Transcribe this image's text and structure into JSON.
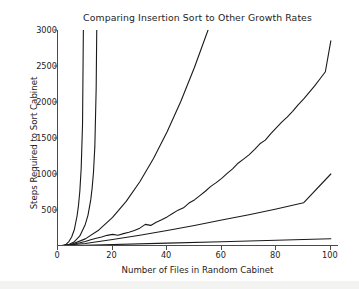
{
  "chart_data": {
    "type": "line",
    "title": "Comparing Insertion Sort to Other Growth Rates",
    "xlabel": "Number of Files in Random Cabinet",
    "ylabel": "Steps Required to Sort Cabinet",
    "xlim": [
      0,
      103
    ],
    "ylim": [
      0,
      3000
    ],
    "xticks": [
      0,
      20,
      40,
      60,
      80,
      100
    ],
    "yticks": [
      500,
      1000,
      1500,
      2000,
      2500,
      3000
    ],
    "grid": false,
    "legend": null,
    "series": [
      {
        "name": "steep-growth-a",
        "note": "fastest growing curve, leaves top of axes near x = 9",
        "x": [
          0,
          1,
          2,
          3,
          4,
          5,
          6,
          7,
          7.5,
          8,
          8.5,
          9,
          9.3
        ],
        "values": [
          0,
          2,
          8,
          26,
          62,
          125,
          230,
          420,
          560,
          760,
          1080,
          1700,
          3000
        ]
      },
      {
        "name": "steep-growth-b",
        "note": "second fastest curve, leaves top of axes near x = 14",
        "x": [
          0,
          2,
          4,
          6,
          8,
          10,
          11,
          12,
          12.5,
          13,
          13.5,
          14,
          14.2
        ],
        "values": [
          0,
          4,
          20,
          60,
          140,
          300,
          430,
          640,
          800,
          1020,
          1380,
          2200,
          3000
        ]
      },
      {
        "name": "quadratic-growth",
        "note": "smooth n-squared style curve, leaves top of axes near x = 55",
        "x": [
          0,
          5,
          10,
          15,
          20,
          25,
          30,
          35,
          40,
          45,
          50,
          55
        ],
        "values": [
          0,
          25,
          99,
          223,
          397,
          620,
          893,
          1215,
          1587,
          2008,
          2479,
          3000
        ]
      },
      {
        "name": "insertion-sort-random",
        "note": "noisy measured insertion sort curve reaching about 2850 at x = 100",
        "x": [
          0,
          2,
          4,
          6,
          8,
          10,
          12,
          14,
          16,
          18,
          20,
          22,
          24,
          26,
          28,
          30,
          32,
          34,
          36,
          38,
          40,
          42,
          44,
          46,
          48,
          50,
          52,
          54,
          56,
          58,
          60,
          62,
          64,
          66,
          68,
          70,
          72,
          74,
          76,
          78,
          80,
          82,
          84,
          86,
          88,
          90,
          92,
          94,
          96,
          98,
          100
        ],
        "values": [
          0,
          5,
          14,
          28,
          44,
          62,
          86,
          108,
          126,
          148,
          162,
          150,
          172,
          190,
          214,
          248,
          300,
          286,
          330,
          366,
          404,
          452,
          498,
          530,
          596,
          640,
          700,
          760,
          828,
          880,
          940,
          1008,
          1072,
          1150,
          1206,
          1266,
          1340,
          1420,
          1470,
          1560,
          1640,
          1720,
          1790,
          1870,
          1960,
          2040,
          2130,
          2220,
          2320,
          2420,
          2850
        ]
      },
      {
        "name": "nlogn-growth",
        "note": "near linear curve reaching about 1000 at x = 100",
        "x": [
          0,
          10,
          20,
          30,
          40,
          50,
          60,
          70,
          80,
          90,
          100
        ],
        "values": [
          0,
          35,
          90,
          150,
          215,
          285,
          360,
          435,
          515,
          600,
          1000
        ]
      },
      {
        "name": "linear-growth",
        "note": "flattest curve reaching about 100 at x = 100",
        "x": [
          0,
          20,
          40,
          60,
          80,
          100
        ],
        "values": [
          0,
          20,
          40,
          60,
          80,
          100
        ]
      }
    ],
    "line_color": "#1a1a1a",
    "axis_color": "#4a4a4a",
    "background_color": "#ffffff"
  }
}
